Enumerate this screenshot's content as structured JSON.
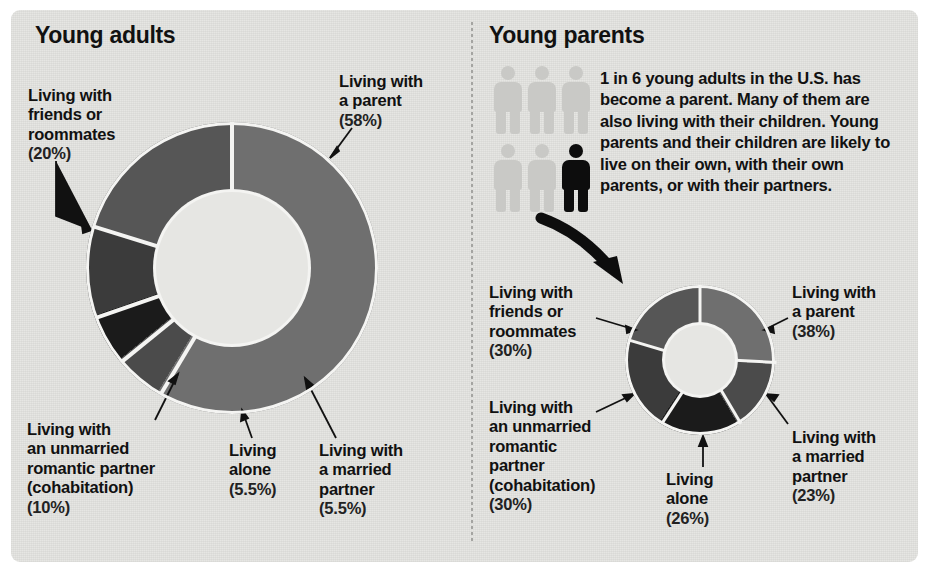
{
  "page": {
    "background": "#ffffff",
    "panel_color": "#e6e6e3",
    "text_color": "#111111"
  },
  "left_panel": {
    "title": "Young adults"
  },
  "right_panel": {
    "title": "Young parents",
    "pictogram": {
      "total": 6,
      "highlighted": 1,
      "highlight_color": "#0d0d0d",
      "base_color": "#c9c9c6"
    },
    "blurb_lead": "1 in 6",
    "blurb_rest": " young adults in the U.S. has become a parent. Many of them are also living with their children. Young parents and their children are likely to live on their own, with their own parents, or with their partners."
  },
  "chart_data": [
    {
      "type": "pie",
      "title": "Young adults",
      "subtitle": "Living arrangements of young adults",
      "donut": true,
      "start_angle_deg": 0,
      "direction": "clockwise",
      "categories": [
        "Living with a parent",
        "Living with a married partner",
        "Living alone",
        "Living with an unmarried romantic partner (cohabitation)",
        "Living with friends or roommates"
      ],
      "values": [
        58,
        5.5,
        5.5,
        10,
        20
      ],
      "value_labels": [
        "(58%)",
        "(5.5%)",
        "(5.5%)",
        "(10%)",
        "(20%)"
      ],
      "colors": [
        "#6f6f6f",
        "#4b4b4b",
        "#1b1b1b",
        "#3b3b3b",
        "#565656"
      ],
      "total": 99,
      "units": "percent"
    },
    {
      "type": "pie",
      "title": "Young parents",
      "subtitle": "Living arrangements of young parents",
      "donut": true,
      "start_angle_deg": 0,
      "direction": "clockwise",
      "categories": [
        "Living with a parent",
        "Living with a married partner",
        "Living alone",
        "Living with an unmarried romantic partner (cohabitation)",
        "Living with friends or roommates"
      ],
      "values": [
        38,
        23,
        26,
        30,
        30
      ],
      "value_labels": [
        "(38%)",
        "(23%)",
        "(26%)",
        "(30%)",
        "(30%)"
      ],
      "colors": [
        "#6f6f6f",
        "#4b4b4b",
        "#1b1b1b",
        "#3b3b3b",
        "#565656"
      ],
      "total": 147,
      "units": "percent",
      "note": "Categories overlap; percentages do not sum to 100."
    }
  ],
  "labels_left": [
    {
      "name": "parent",
      "line1": "Living with",
      "line2": "a parent",
      "line3": "",
      "line4": "",
      "pct": "(58%)"
    },
    {
      "name": "friends",
      "line1": "Living with",
      "line2": "friends or",
      "line3": "roommates",
      "line4": "",
      "pct": "(20%)"
    },
    {
      "name": "cohab",
      "line1": "Living with",
      "line2": "an unmarried",
      "line3": "romantic partner",
      "line4": "(cohabitation)",
      "pct": "(10%)"
    },
    {
      "name": "alone",
      "line1": "Living",
      "line2": "alone",
      "line3": "",
      "line4": "",
      "pct": "(5.5%)"
    },
    {
      "name": "married",
      "line1": "Living with",
      "line2": "a married",
      "line3": "partner",
      "line4": "",
      "pct": "(5.5%)"
    }
  ],
  "labels_right": [
    {
      "name": "friends",
      "line1": "Living with",
      "line2": "friends or",
      "line3": "roommates",
      "line4": "",
      "line5": "",
      "pct": "(30%)"
    },
    {
      "name": "parent",
      "line1": "Living with",
      "line2": "a parent",
      "line3": "",
      "line4": "",
      "line5": "",
      "pct": "(38%)"
    },
    {
      "name": "cohab",
      "line1": "Living with",
      "line2": "an unmarried",
      "line3": "romantic",
      "line4": "partner",
      "line5": "(cohabitation)",
      "pct": "(30%)"
    },
    {
      "name": "married",
      "line1": "Living with",
      "line2": "a married",
      "line3": "partner",
      "line4": "",
      "line5": "",
      "pct": "(23%)"
    },
    {
      "name": "alone",
      "line1": "Living",
      "line2": "alone",
      "line3": "",
      "line4": "",
      "line5": "",
      "pct": "(26%)"
    }
  ]
}
